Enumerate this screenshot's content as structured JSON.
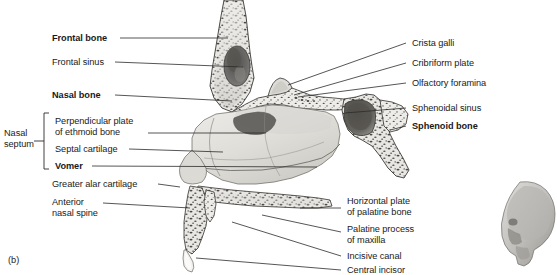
{
  "figure": {
    "caption": "(b)",
    "background_color": "#ffffff",
    "line_color": "#2b2b2b",
    "text_color": "#1a1a1a",
    "bone_fill": "#e6e4e0",
    "bone_shadow": "#b9b7b3",
    "cavity_dark": "#6e6c6a",
    "inset_fill": "#cfcdc9"
  },
  "group_labels": [
    {
      "id": "nasal-septum",
      "line1": "Nasal",
      "line2": "septum",
      "x": 4,
      "y": 128,
      "bracket": {
        "x": 44,
        "top": 113,
        "bottom": 169,
        "tick": 5
      }
    }
  ],
  "labels_left": [
    {
      "id": "frontal-bone",
      "text": "Frontal bone",
      "bold": true,
      "x": 52,
      "y": 33,
      "anchor_x": 120,
      "anchor_y": 38,
      "target_x": 228,
      "target_y": 38
    },
    {
      "id": "frontal-sinus",
      "text": "Frontal sinus",
      "bold": false,
      "x": 52,
      "y": 57,
      "anchor_x": 115,
      "anchor_y": 62,
      "target_x": 243,
      "target_y": 67
    },
    {
      "id": "nasal-bone",
      "text": "Nasal bone",
      "bold": true,
      "x": 52,
      "y": 90,
      "anchor_x": 115,
      "anchor_y": 95,
      "target_x": 232,
      "target_y": 101
    },
    {
      "id": "perpendicular-plate",
      "text": "Perpendicular plate\nof ethmoid bone",
      "bold": false,
      "x": 55,
      "y": 116,
      "anchor_x": 148,
      "anchor_y": 133,
      "target_x": 266,
      "target_y": 133
    },
    {
      "id": "septal-cartilage",
      "text": "Septal cartilage",
      "bold": false,
      "x": 55,
      "y": 144,
      "anchor_x": 129,
      "anchor_y": 149,
      "target_x": 223,
      "target_y": 152
    },
    {
      "id": "vomer",
      "text": "Vomer",
      "bold": true,
      "x": 55,
      "y": 161,
      "anchor_x": 92,
      "anchor_y": 166,
      "target_x": 317,
      "target_y": 167
    },
    {
      "id": "greater-alar-cartilage",
      "text": "Greater alar cartilage",
      "bold": false,
      "x": 52,
      "y": 179,
      "anchor_x": 158,
      "anchor_y": 184,
      "target_x": 180,
      "target_y": 187
    },
    {
      "id": "anterior-nasal-spine",
      "text": "Anterior\nnasal spine",
      "bold": false,
      "x": 52,
      "y": 197,
      "anchor_x": 103,
      "anchor_y": 203,
      "target_x": 190,
      "target_y": 208
    }
  ],
  "labels_right": [
    {
      "id": "crista-galli",
      "text": "Crista galli",
      "bold": false,
      "x": 412,
      "y": 38,
      "anchor_x": 406,
      "anchor_y": 43,
      "target_x": 288,
      "target_y": 85
    },
    {
      "id": "cribriform-plate",
      "text": "Cribriform plate",
      "bold": false,
      "x": 412,
      "y": 58,
      "anchor_x": 406,
      "anchor_y": 63,
      "target_x": 294,
      "target_y": 95
    },
    {
      "id": "olfactory-foramina",
      "text": "Olfactory foramina",
      "bold": false,
      "x": 412,
      "y": 78,
      "anchor_x": 406,
      "anchor_y": 83,
      "target_x": 298,
      "target_y": 97
    },
    {
      "id": "sphenoidal-sinus",
      "text": "Sphenoidal sinus",
      "bold": false,
      "x": 412,
      "y": 103,
      "anchor_x": 406,
      "anchor_y": 108,
      "target_x": 345,
      "target_y": 113
    },
    {
      "id": "sphenoid-bone",
      "text": "Sphenoid bone",
      "bold": true,
      "x": 412,
      "y": 121,
      "anchor_x": 406,
      "anchor_y": 126,
      "target_x": 390,
      "target_y": 130
    }
  ],
  "labels_bottom_right": [
    {
      "id": "horizontal-plate-palatine",
      "text": "Horizontal plate\nof palatine bone",
      "bold": false,
      "x": 347,
      "y": 196,
      "anchor_x": 341,
      "anchor_y": 208,
      "target_x": 300,
      "target_y": 208
    },
    {
      "id": "palatine-process-maxilla",
      "text": "Palatine process\nof maxilla",
      "bold": false,
      "x": 347,
      "y": 224,
      "anchor_x": 341,
      "anchor_y": 232,
      "target_x": 262,
      "target_y": 215
    },
    {
      "id": "incisive-canal",
      "text": "Incisive canal",
      "bold": false,
      "x": 347,
      "y": 251,
      "anchor_x": 341,
      "anchor_y": 256,
      "target_x": 232,
      "target_y": 222
    },
    {
      "id": "central-incisor",
      "text": "Central incisor",
      "bold": false,
      "x": 347,
      "y": 265,
      "anchor_x": 341,
      "anchor_y": 270,
      "target_x": 196,
      "target_y": 258
    }
  ],
  "inset": {
    "id": "skull-orientation-inset",
    "description": "lateral skull profile orientation inset",
    "x": 497,
    "y": 178,
    "width": 58,
    "height": 96
  }
}
